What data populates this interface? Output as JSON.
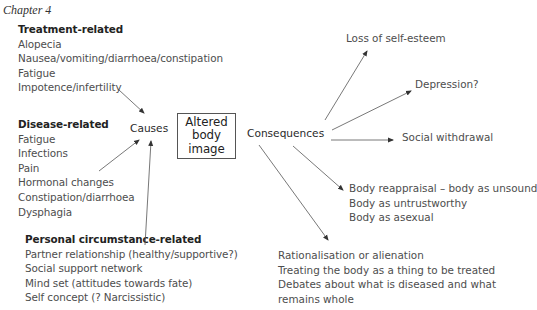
{
  "header": {
    "chapter": "Chapter 4"
  },
  "center": {
    "box_lines": [
      "Altered",
      "body",
      "image"
    ],
    "causes_label": "Causes",
    "consequences_label": "Consequences"
  },
  "causes": {
    "treatment": {
      "heading": "Treatment-related",
      "items": [
        "Alopecia",
        "Nausea/vomiting/diarrhoea/constipation",
        "Fatigue",
        "Impotence/infertility"
      ]
    },
    "disease": {
      "heading": "Disease-related",
      "items": [
        "Fatigue",
        "Infections",
        "Pain",
        "Hormonal changes",
        "Constipation/diarrhoea",
        "Dysphagia"
      ]
    },
    "personal": {
      "heading": "Personal circumstance-related",
      "items": [
        "Partner relationship (healthy/supportive?)",
        "Social support network",
        "Mind set (attitudes towards fate)",
        "Self concept (? Narcissistic)"
      ]
    }
  },
  "consequences": {
    "loss_self_esteem": "Loss of self-esteem",
    "depression": "Depression?",
    "social_withdrawal": "Social withdrawal",
    "body_reappraisal": [
      "Body reappraisal – body as unsound",
      "Body as untrustworthy",
      "Body as asexual"
    ],
    "rationalisation": [
      "Rationalisation or alienation",
      "Treating the body as a thing to be treated",
      "Debates about what is diseased and what",
      "remains whole"
    ]
  }
}
